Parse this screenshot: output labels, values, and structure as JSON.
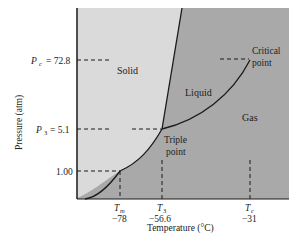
{
  "diagram": {
    "y_axis_label": "Pressure (atm)",
    "x_axis_label": "Temperature (°C)",
    "regions": {
      "solid": "Solid",
      "liquid": "Liquid",
      "gas": "Gas"
    },
    "points": {
      "critical_line1": "Critical",
      "critical_line2": "point",
      "triple_line1": "Triple",
      "triple_line2": "point"
    },
    "y_ticks": {
      "pc_symbol": "P",
      "pc_sub": "c",
      "pc_value": "= 72.8",
      "p3_symbol": "P",
      "p3_sub": "3",
      "p3_value": "= 5.1",
      "p1_value": "1.00"
    },
    "x_ticks": {
      "tm_symbol": "T",
      "tm_sub": "m",
      "tm_value": "−78",
      "t3_symbol": "T",
      "t3_sub": "3",
      "t3_value": "−56.6",
      "tc_symbol": "T",
      "tc_sub": "c",
      "tc_value": "−31"
    },
    "colors": {
      "solid_fill": "#d9d9d9",
      "fluid_fill": "#a9a9a9",
      "line": "#1a1a1a"
    }
  }
}
